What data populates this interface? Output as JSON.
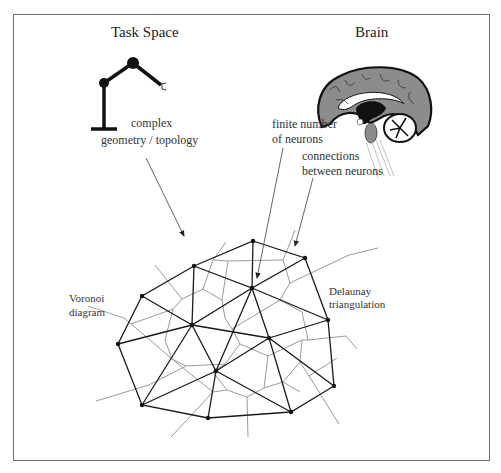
{
  "titles": {
    "task_space": "Task Space",
    "brain": "Brain"
  },
  "labels": {
    "complex_line1": "complex",
    "complex_line2": "geometry / topology",
    "finite_line1": "finite number",
    "finite_line2": "of neurons",
    "connections_line1": "connections",
    "connections_line2": "between neurons",
    "voronoi_line1": "Voronoi",
    "voronoi_line2": "diagram",
    "delaunay_line1": "Delaunay",
    "delaunay_line2": "triangulation"
  },
  "icons": [
    "robot-arm-icon",
    "brain-icon",
    "arrow-icon"
  ],
  "colors": {
    "delaunay_edge": "#1a1a1a",
    "voronoi_edge": "#9a9a9a",
    "frame": "#6d6d6d",
    "brain_gray": "#8c8c8c"
  },
  "mesh": {
    "nodes": [
      {
        "id": "A",
        "x": 253,
        "y": 241
      },
      {
        "id": "B",
        "x": 194,
        "y": 266
      },
      {
        "id": "C",
        "x": 305,
        "y": 258
      },
      {
        "id": "D",
        "x": 142,
        "y": 296
      },
      {
        "id": "E",
        "x": 252,
        "y": 288
      },
      {
        "id": "F",
        "x": 192,
        "y": 325
      },
      {
        "id": "G",
        "x": 328,
        "y": 320
      },
      {
        "id": "H",
        "x": 118,
        "y": 344
      },
      {
        "id": "I",
        "x": 269,
        "y": 338
      },
      {
        "id": "J",
        "x": 216,
        "y": 371
      },
      {
        "id": "K",
        "x": 334,
        "y": 386
      },
      {
        "id": "L",
        "x": 142,
        "y": 405
      },
      {
        "id": "M",
        "x": 208,
        "y": 418
      },
      {
        "id": "N",
        "x": 291,
        "y": 412
      }
    ]
  }
}
